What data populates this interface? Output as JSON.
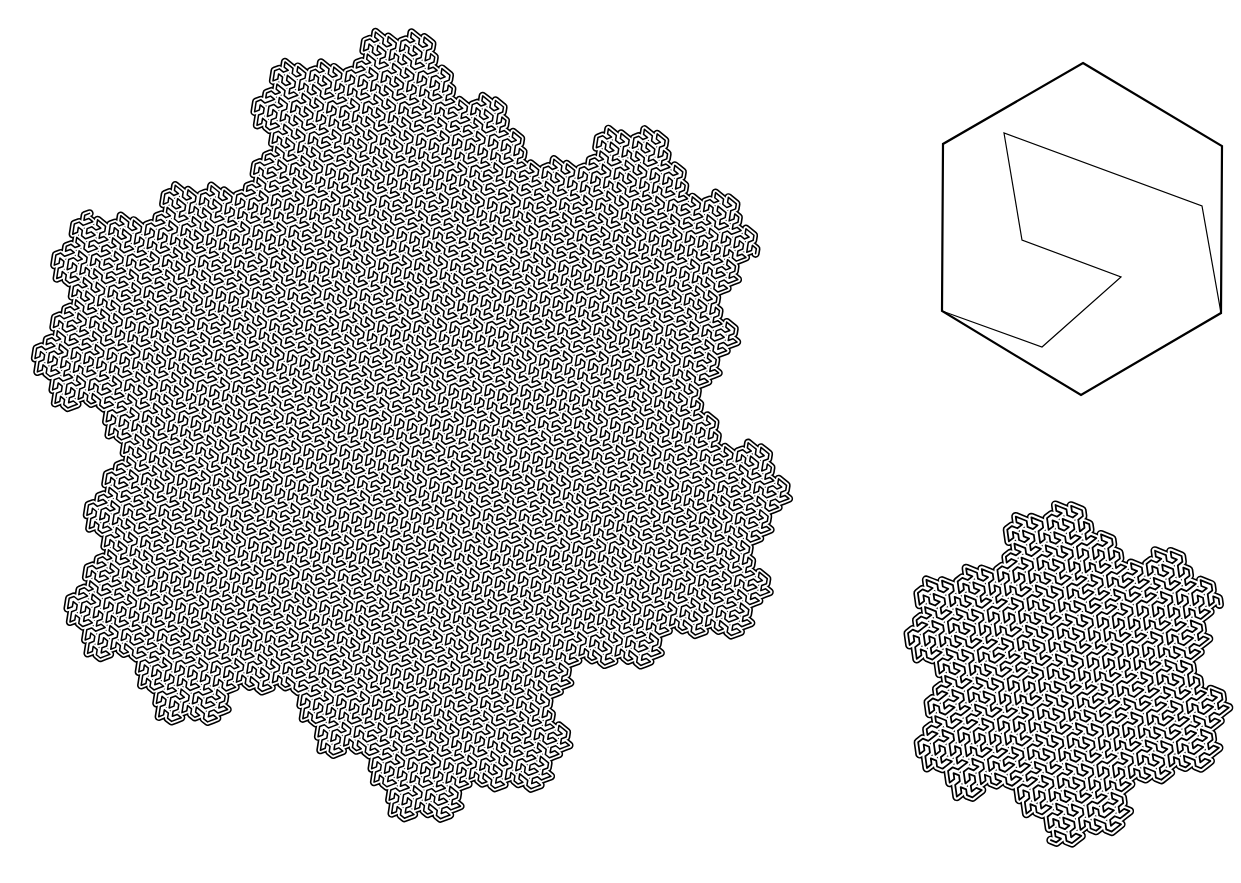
{
  "figure": {
    "title": "Gosper curve (flowsnake)",
    "background": "#ffffff",
    "ink": "#000000",
    "large_curve": {
      "order": 5,
      "extremes": {
        "top": [
          355,
          32
        ],
        "right": [
          780,
          478
        ],
        "bottom": [
          430,
          828
        ],
        "left": [
          35,
          380
        ]
      }
    },
    "small_curve": {
      "order": 4,
      "extremes": {
        "top": [
          1050,
          505
        ],
        "right": [
          1227,
          693
        ],
        "bottom": [
          1075,
          845
        ],
        "left": [
          908,
          650
        ]
      }
    },
    "generator": {
      "hexagon": [
        [
          1083,
          63
        ],
        [
          1222,
          146
        ],
        [
          1221,
          313
        ],
        [
          1081,
          395
        ],
        [
          942,
          311
        ],
        [
          943,
          144
        ]
      ],
      "path": [
        [
          942,
          311
        ],
        [
          1042,
          347
        ],
        [
          1121,
          277
        ],
        [
          1022,
          240
        ],
        [
          1004,
          133
        ],
        [
          1202,
          206
        ],
        [
          1221,
          313
        ]
      ]
    }
  }
}
